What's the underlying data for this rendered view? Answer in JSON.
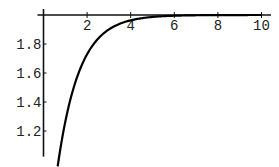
{
  "chart_data": {
    "type": "line",
    "title": "",
    "xlabel": "",
    "ylabel": "",
    "function": "y = 2 - 2*exp(-x)",
    "xlim": [
      -0.05,
      10.3
    ],
    "ylim": [
      1.03,
      2.02
    ],
    "axes_origin": [
      0,
      2.0
    ],
    "x_ticks": [
      2,
      4,
      6,
      8,
      10
    ],
    "x_tick_labels": [
      "2",
      "4",
      "6",
      "8",
      "10"
    ],
    "y_ticks": [
      1.2,
      1.4,
      1.6,
      1.8
    ],
    "y_tick_labels": [
      "1.2",
      "1.4",
      "1.6",
      "1.8"
    ],
    "grid": false,
    "legend": "none",
    "series": [
      {
        "name": "curve",
        "color": "#000000",
        "x": [
          0.65,
          0.8,
          1.0,
          1.2,
          1.5,
          1.8,
          2.0,
          2.3,
          2.6,
          3.0,
          3.5,
          4.0,
          4.5,
          5.0,
          5.5,
          6.0,
          7.0,
          8.0,
          9.0,
          10.0
        ],
        "y": [
          1.04,
          1.1,
          1.26,
          1.4,
          1.55,
          1.67,
          1.73,
          1.8,
          1.85,
          1.9,
          1.94,
          1.96,
          1.98,
          1.99,
          1.99,
          2.0,
          2.0,
          2.0,
          2.0,
          2.0
        ]
      }
    ]
  }
}
